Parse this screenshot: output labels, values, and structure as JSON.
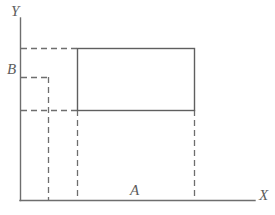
{
  "figure": {
    "width": 275,
    "height": 215,
    "background_color": "#ffffff",
    "line_color": "#6e6e6e",
    "solid_line_width": 1.2,
    "dashed_line_width": 1.2,
    "dash_pattern": "6,4"
  },
  "labels": {
    "y_axis": "Y",
    "x_axis": "X",
    "height_marker": "B",
    "width_marker": "A"
  },
  "chart_data": {
    "type": "diagram",
    "title": "",
    "xlabel": "X",
    "ylabel": "Y",
    "grid": false,
    "legend": null,
    "axes": {
      "origin": {
        "x": 20,
        "y": 200
      },
      "x_axis": {
        "x1": 20,
        "y1": 200,
        "x2": 255,
        "y2": 200,
        "style": "solid"
      },
      "y_axis": {
        "x1": 20,
        "y1": 18,
        "x2": 20,
        "y2": 200,
        "style": "solid"
      }
    },
    "shapes": [
      {
        "name": "rectangle",
        "style": "solid",
        "left": 77,
        "top": 48,
        "right": 194,
        "bottom": 110,
        "width": 117,
        "height": 62
      }
    ],
    "dashed_lines": [
      {
        "name": "top-horizontal-guide",
        "x1": 21,
        "y1": 48,
        "x2": 77,
        "y2": 48
      },
      {
        "name": "b-level-horizontal-guide",
        "x1": 21,
        "y1": 77,
        "x2": 49,
        "y2": 77
      },
      {
        "name": "rect-bottom-horizontal-guide",
        "x1": 21,
        "y1": 110,
        "x2": 77,
        "y2": 110
      },
      {
        "name": "inner-vertical-guide",
        "x1": 48,
        "y1": 77,
        "x2": 48,
        "y2": 200
      },
      {
        "name": "rect-left-vertical-guide",
        "x1": 77,
        "y1": 110,
        "x2": 77,
        "y2": 200
      },
      {
        "name": "rect-right-vertical-guide",
        "x1": 194,
        "y1": 110,
        "x2": 194,
        "y2": 200
      }
    ],
    "annotations": [
      {
        "text": "Y",
        "x": 14,
        "y": 11,
        "role": "y-axis-name"
      },
      {
        "text": "X",
        "x": 264,
        "y": 196,
        "role": "x-axis-name"
      },
      {
        "text": "B",
        "x": 12,
        "y": 70,
        "role": "y-value-marker"
      },
      {
        "text": "A",
        "x": 136,
        "y": 191,
        "role": "x-span-marker"
      }
    ]
  }
}
